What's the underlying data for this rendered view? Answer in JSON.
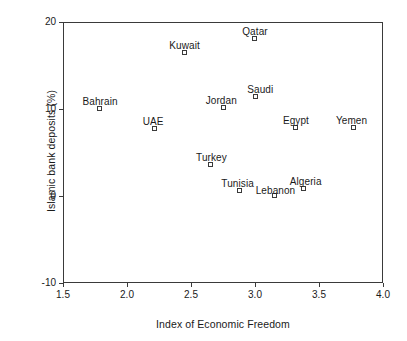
{
  "chart_data": {
    "type": "scatter",
    "title": "",
    "xlabel": "Index of Economic Freedom",
    "ylabel": "Islamic bank deposits (%)",
    "xlim": [
      1.5,
      4.0
    ],
    "ylim": [
      -10,
      20
    ],
    "xticks": [
      "1.5",
      "2.0",
      "2.5",
      "3.0",
      "3.5",
      "4.0"
    ],
    "xtick_values": [
      1.5,
      2.0,
      2.5,
      3.0,
      3.5,
      4.0
    ],
    "yticks": [
      "20",
      "10",
      "0",
      "-10"
    ],
    "ytick_values": [
      20,
      10,
      0,
      -10
    ],
    "grid": false,
    "legend": "none",
    "marker_style": "open-square",
    "points": [
      {
        "name": "Bahrain",
        "x": 1.79,
        "y": 10.0,
        "label_dx": 0,
        "label_dy": -13
      },
      {
        "name": "UAE",
        "x": 2.22,
        "y": 7.7,
        "label_dx": -2,
        "label_dy": -13
      },
      {
        "name": "Kuwait",
        "x": 2.45,
        "y": 16.4,
        "label_dx": 0,
        "label_dy": -13
      },
      {
        "name": "Turkey",
        "x": 2.66,
        "y": 3.6,
        "label_dx": 0,
        "label_dy": -13
      },
      {
        "name": "Jordan",
        "x": 2.76,
        "y": 10.1,
        "label_dx": -3,
        "label_dy": -13
      },
      {
        "name": "Tunisia",
        "x": 2.88,
        "y": 0.6,
        "label_dx": -2,
        "label_dy": -13
      },
      {
        "name": "Qatar",
        "x": 3.0,
        "y": 18.0,
        "label_dx": 0,
        "label_dy": -13
      },
      {
        "name": "Saudi",
        "x": 3.01,
        "y": 11.4,
        "label_dx": 4,
        "label_dy": -13
      },
      {
        "name": "Lebanon",
        "x": 3.16,
        "y": 0.0,
        "label_dx": 0,
        "label_dy": -11
      },
      {
        "name": "Egypt",
        "x": 3.32,
        "y": 7.8,
        "label_dx": 0,
        "label_dy": -13
      },
      {
        "name": "Algeria",
        "x": 3.38,
        "y": 0.8,
        "label_dx": 2,
        "label_dy": -13
      },
      {
        "name": "Yemen",
        "x": 3.77,
        "y": 7.8,
        "label_dx": -2,
        "label_dy": -13
      }
    ]
  },
  "axes": {
    "x_title": "Index of Economic Freedom",
    "y_title": "Islamic bank deposits (%)"
  },
  "colors": {
    "axis": "#3a3a3a",
    "text": "#1a1a1a",
    "marker_edge": "#3a3a3a",
    "marker_fill": "#ffffff",
    "background": "#ffffff"
  }
}
